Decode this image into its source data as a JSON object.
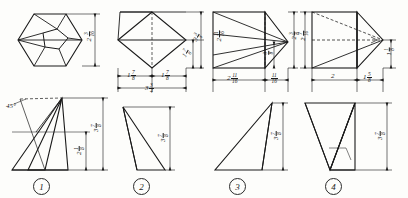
{
  "sheet": {
    "title": "Drafting exercise sheet — four solids, top and front views",
    "background_color": "#fdfdfb",
    "line_color": "#1a1a1a",
    "units": "inches"
  },
  "figures": [
    {
      "id": "figure-1",
      "number": "1",
      "top_view": {
        "shape": "hexagon-with-inner-pentagon",
        "dimensions": [
          {
            "name": "height",
            "value": "2",
            "fraction_num": "3",
            "fraction_den": "16",
            "orientation": "vertical",
            "side": "right"
          }
        ]
      },
      "front_view": {
        "shape": "triangular-pyramid-front",
        "dimensions": [
          {
            "name": "overall-height",
            "value": "3",
            "fraction_num": "7",
            "fraction_den": "8",
            "orientation": "vertical",
            "side": "right-outer"
          },
          {
            "name": "partial-height",
            "value": "2",
            "fraction_num": "1",
            "fraction_den": "8",
            "orientation": "vertical",
            "side": "right-inner"
          },
          {
            "name": "angle",
            "value": "45°",
            "orientation": "horizontal",
            "side": "upper-left"
          }
        ]
      }
    },
    {
      "id": "figure-2",
      "number": "2",
      "top_view": {
        "shape": "diamond-in-square",
        "dimensions": [
          {
            "name": "left-half-width",
            "value": "1",
            "fraction_num": "7",
            "fraction_den": "8",
            "orientation": "horizontal",
            "side": "bottom-left"
          },
          {
            "name": "right-half-width",
            "value": "1",
            "fraction_num": "7",
            "fraction_den": "8",
            "orientation": "horizontal",
            "side": "bottom-right"
          },
          {
            "name": "overall-width",
            "value": "3",
            "fraction_num": "3",
            "fraction_den": "4",
            "orientation": "horizontal",
            "side": "bottom-outer"
          },
          {
            "name": "inner-height",
            "value": "1",
            "fraction_num": "7",
            "fraction_den": "8",
            "orientation": "vertical",
            "side": "right-inner"
          },
          {
            "name": "overall-height",
            "value": "3",
            "fraction_num": "3",
            "fraction_den": "4",
            "orientation": "vertical",
            "side": "right-outer"
          }
        ]
      },
      "front_view": {
        "shape": "obtuse-triangle",
        "dimensions": [
          {
            "name": "height",
            "value": "3",
            "fraction_num": "7",
            "fraction_den": "8",
            "orientation": "vertical",
            "side": "right"
          }
        ]
      }
    },
    {
      "id": "figure-3",
      "number": "3",
      "top_view": {
        "shape": "square-with-apex-wedge",
        "dimensions": [
          {
            "name": "body-width",
            "value": "2",
            "fraction_num": "11",
            "fraction_den": "16",
            "orientation": "horizontal",
            "side": "bottom-left"
          },
          {
            "name": "wedge-width",
            "value": "",
            "fraction_num": "11",
            "fraction_den": "16",
            "orientation": "horizontal",
            "side": "bottom-right"
          },
          {
            "name": "body-height",
            "value": "2",
            "fraction_num": "11",
            "fraction_den": "16",
            "orientation": "vertical",
            "side": "left-inner"
          },
          {
            "name": "apex-offset",
            "value": "",
            "fraction_num": "3",
            "fraction_den": "8",
            "orientation": "vertical",
            "side": "center-right"
          },
          {
            "name": "overall-height",
            "value": "2",
            "fraction_num": "3",
            "fraction_den": "8",
            "orientation": "vertical",
            "side": "right-outer"
          }
        ]
      },
      "front_view": {
        "shape": "right-leaning-triangle",
        "dimensions": [
          {
            "name": "height",
            "value": "3",
            "fraction_num": "7",
            "fraction_den": "8",
            "orientation": "vertical",
            "side": "right"
          }
        ]
      }
    },
    {
      "id": "figure-4",
      "number": "4",
      "top_view": {
        "shape": "square-with-pointed-wedge",
        "dimensions": [
          {
            "name": "body-width",
            "value": "2",
            "fraction_num": "",
            "fraction_den": "",
            "orientation": "horizontal",
            "side": "bottom-left"
          },
          {
            "name": "wedge-width",
            "value": "1",
            "fraction_num": "5",
            "fraction_den": "8",
            "orientation": "horizontal",
            "side": "bottom-right"
          },
          {
            "name": "body-height",
            "value": "2",
            "fraction_num": "7",
            "fraction_den": "16",
            "orientation": "vertical",
            "side": "left-outer"
          },
          {
            "name": "apex-height",
            "value": "1",
            "fraction_num": "1",
            "fraction_den": "8",
            "orientation": "vertical",
            "side": "right-outer"
          }
        ]
      },
      "front_view": {
        "shape": "slanted-parallelogram",
        "dimensions": [
          {
            "name": "height",
            "value": "3",
            "fraction_num": "7",
            "fraction_den": "8",
            "orientation": "vertical",
            "side": "right"
          }
        ]
      }
    }
  ],
  "labels": {
    "fig1_top_h": {
      "whole": "2",
      "num": "3",
      "den": "16"
    },
    "fig1_front_total": {
      "whole": "3",
      "num": "7",
      "den": "8"
    },
    "fig1_front_partial": {
      "whole": "2",
      "num": "1",
      "den": "8"
    },
    "fig1_angle": "45°",
    "fig2_left": {
      "whole": "1",
      "num": "7",
      "den": "8"
    },
    "fig2_right": {
      "whole": "1",
      "num": "7",
      "den": "8"
    },
    "fig2_total_w": {
      "whole": "3",
      "num": "3",
      "den": "4"
    },
    "fig2_inner_v": {
      "whole": "1",
      "num": "7",
      "den": "8"
    },
    "fig2_outer_v": {
      "whole": "3",
      "num": "3",
      "den": "4"
    },
    "fig2_front_v": {
      "whole": "3",
      "num": "7",
      "den": "8"
    },
    "fig3_body_w": {
      "whole": "2",
      "num": "11",
      "den": "16"
    },
    "fig3_wedge_w": {
      "whole": "",
      "num": "11",
      "den": "16"
    },
    "fig3_body_v": {
      "whole": "2",
      "num": "11",
      "den": "16"
    },
    "fig3_apex_v": {
      "whole": "",
      "num": "3",
      "den": "8"
    },
    "fig3_outer_v": {
      "whole": "2",
      "num": "3",
      "den": "8"
    },
    "fig3_front_v": {
      "whole": "3",
      "num": "7",
      "den": "8"
    },
    "fig4_body_w": {
      "whole": "2",
      "num": "",
      "den": ""
    },
    "fig4_wedge_w": {
      "whole": "1",
      "num": "5",
      "den": "8"
    },
    "fig4_body_v": {
      "whole": "2",
      "num": "7",
      "den": "16"
    },
    "fig4_apex_v": {
      "whole": "1",
      "num": "1",
      "den": "8"
    },
    "fig4_front_v": {
      "whole": "3",
      "num": "7",
      "den": "8"
    },
    "num1": "1",
    "num2": "2",
    "num3": "3",
    "num4": "4"
  }
}
